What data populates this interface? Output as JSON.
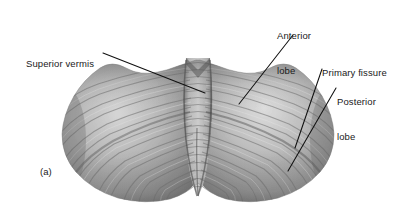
{
  "figure": {
    "caption_label": "(a)",
    "background_color": "#ffffff",
    "label_color": "#1a1a1a",
    "leader_line_color": "#111111"
  },
  "labels": {
    "superior_vermis": {
      "text": "Superior vermis",
      "lines": [
        "Superior vermis"
      ],
      "leader_from": [
        103,
        53
      ],
      "leader_to": [
        205,
        93
      ]
    },
    "anterior_lobe": {
      "text": "Anterior lobe",
      "lines": [
        "Anterior",
        "lobe"
      ],
      "leader_from": [
        293,
        35
      ],
      "leader_to": [
        239,
        104
      ]
    },
    "primary_fissure": {
      "text": "Primary fissure",
      "lines": [
        "Primary fissure"
      ],
      "leader_from": [
        322,
        69
      ],
      "leader_to": [
        295,
        148
      ]
    },
    "posterior_lobe": {
      "text": "Posterior lobe",
      "lines": [
        "Posterior",
        "lobe"
      ],
      "leader_from": [
        336,
        88
      ],
      "leader_to": [
        288,
        171
      ]
    }
  },
  "anatomy": {
    "regions": [
      {
        "name": "left-cerebellar-hemisphere",
        "tone": "#9a9a9a"
      },
      {
        "name": "right-cerebellar-hemisphere",
        "tone": "#a8a8a8"
      },
      {
        "name": "superior-vermis",
        "tone": "#b4b4b4"
      },
      {
        "name": "anterior-lobe",
        "tone": "#b8b8b8"
      },
      {
        "name": "posterior-lobe",
        "tone": "#8e8e8e"
      },
      {
        "name": "primary-fissure",
        "tone": "#6f6f6f"
      }
    ]
  }
}
